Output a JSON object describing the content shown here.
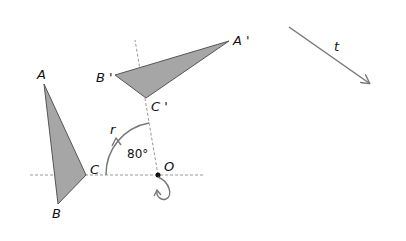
{
  "diagram": {
    "title": "",
    "colors": {
      "fill": "#a6a6a6",
      "stroke": "#555555",
      "dashed": "#999999",
      "arrow": "#777777"
    },
    "original_triangle": {
      "points": {
        "A": [
          44,
          84
        ],
        "B": [
          58,
          204
        ],
        "C": [
          86,
          175
        ]
      },
      "labels": {
        "A": "A",
        "B": "B",
        "C": "C"
      }
    },
    "image_triangle": {
      "points": {
        "A": [
          229,
          41
        ],
        "B": [
          115,
          75
        ],
        "C": [
          146,
          98
        ]
      },
      "labels": {
        "A": "A '",
        "B": "B '",
        "C": "C '"
      }
    },
    "center": {
      "point": [
        158,
        175
      ],
      "label": "O"
    },
    "rotation": {
      "label": "r",
      "angle": "80°"
    },
    "translation": {
      "label": "t"
    }
  }
}
